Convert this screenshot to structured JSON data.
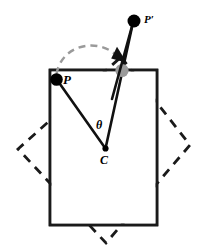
{
  "figure": {
    "labels": {
      "original_point": "P",
      "rotated_point": "P′",
      "center_point": "C",
      "angle": "θ"
    },
    "colors": {
      "stroke": "#1a1a1a",
      "dashed_outline": "#1a1a1a",
      "arc": "#9a9a9a",
      "rotated_marker": "#9a9a9a",
      "point_fill": "#000000",
      "background": "#ffffff"
    },
    "geometry": {
      "solid_rectangle": {
        "name": "original-rectangle",
        "x": 50,
        "y": 70,
        "width": 107,
        "height": 155,
        "stroke_width": 2.6,
        "style": "solid"
      },
      "dashed_rectangle": {
        "name": "rotated-rectangle",
        "points": "121,57 190,145 106,243 18,149",
        "stroke_width": 2.8,
        "dash": "9 7",
        "style": "dashed"
      },
      "center": {
        "cx": 105.5,
        "cy": 148.5,
        "r": 3.0
      },
      "point_p": {
        "cx": 56.5,
        "cy": 79.5,
        "r": 6.2
      },
      "point_p_prime": {
        "cx": 134.0,
        "cy": 21.0,
        "r": 6.4
      },
      "marker_rotated": {
        "cx": 122.0,
        "cy": 70.5,
        "r": 6.4
      },
      "radius_line_cp": {
        "x1": 105.5,
        "y1": 148.5,
        "x2": 57.5,
        "y2": 80.5
      },
      "radius_line_cpprime": {
        "x1": 105.5,
        "y1": 148.5,
        "x2": 133.0,
        "y2": 22.0
      },
      "rotation_arc": {
        "path": "M 56.5 74.0 C 62 44, 104 38, 121.5 61.0",
        "dash": "7 5",
        "stroke_width": 2.4
      },
      "arc_arrowhead": {
        "points": "116.5,47.5 125.5,64.5 110.5,60.0",
        "rotation": -8
      }
    }
  }
}
